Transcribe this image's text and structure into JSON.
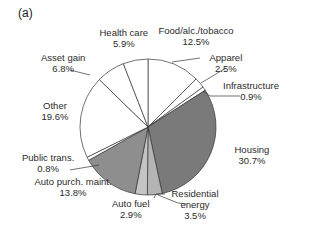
{
  "panel_label": "(a)",
  "chart_data": {
    "type": "pie",
    "title": "",
    "start_angle_deg": 0,
    "direction": "clockwise",
    "slices": [
      {
        "name": "Food/alc./tobacco",
        "value": 12.5,
        "label": "12.5%",
        "color": "#ffffff"
      },
      {
        "name": "Apparel",
        "value": 2.5,
        "label": "2.5%",
        "color": "#ffffff"
      },
      {
        "name": "Infrastructure",
        "value": 0.9,
        "label": "0.9%",
        "color": "#ffffff"
      },
      {
        "name": "Housing",
        "value": 30.7,
        "label": "30.7%",
        "color": "#7a7a7a"
      },
      {
        "name": "Residential energy",
        "value": 3.5,
        "label": "3.5%",
        "color": "#b4b4b4"
      },
      {
        "name": "Auto fuel",
        "value": 2.9,
        "label": "2.9%",
        "color": "#c4c4c4"
      },
      {
        "name": "Auto purch. maint.",
        "value": 13.8,
        "label": "13.8%",
        "color": "#8e8e8e"
      },
      {
        "name": "Public trans.",
        "value": 0.8,
        "label": "0.8%",
        "color": "#ffffff"
      },
      {
        "name": "Other",
        "value": 19.6,
        "label": "19.6%",
        "color": "#ffffff"
      },
      {
        "name": "Asset gain",
        "value": 6.8,
        "label": "6.8%",
        "color": "#ffffff"
      },
      {
        "name": "Health care",
        "value": 5.9,
        "label": "5.9%",
        "color": "#ffffff"
      }
    ]
  },
  "labels": [
    {
      "line1": "Food/alc./tobacco",
      "line2": "12.5%",
      "x": 196,
      "y": 36
    },
    {
      "line1": "Apparel",
      "line2": "2.5%",
      "x": 226,
      "y": 63
    },
    {
      "line1": "Infrastructure",
      "line2": "0.9%",
      "x": 251,
      "y": 91
    },
    {
      "line1": "Housing",
      "line2": "30.7%",
      "x": 252,
      "y": 155
    },
    {
      "line1": "Residential",
      "line2": "energy",
      "line3": "3.5%",
      "x": 195,
      "y": 199
    },
    {
      "line1": "Auto fuel",
      "line2": "2.9%",
      "x": 131,
      "y": 209
    },
    {
      "line1": "Auto purch. maint.",
      "line2": "13.8%",
      "x": 73,
      "y": 187
    },
    {
      "line1": "Public trans.",
      "line2": "0.8%",
      "x": 48,
      "y": 163
    },
    {
      "line1": "Other",
      "line2": "19.6%",
      "x": 55,
      "y": 111
    },
    {
      "line1": "Asset gain",
      "line2": "6.8%",
      "x": 63,
      "y": 63
    },
    {
      "line1": "Health care",
      "line2": "5.9%",
      "x": 124,
      "y": 38
    }
  ],
  "leaders": [
    [
      172,
      62,
      200,
      58
    ],
    [
      201,
      83,
      226,
      68
    ],
    [
      203,
      91,
      210,
      96,
      240,
      96
    ],
    [
      154,
      198,
      156,
      194,
      165,
      194
    ],
    [
      158,
      195,
      178,
      203,
      186,
      204
    ],
    [
      99,
      165,
      70,
      170
    ],
    [
      90,
      75,
      70,
      70
    ]
  ]
}
